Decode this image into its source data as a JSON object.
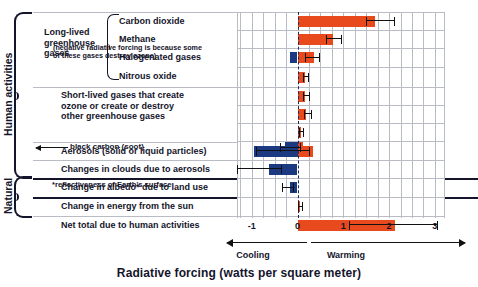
{
  "groups": {
    "human_label": "Human activities",
    "natural_label": "Natural",
    "long_lived_label": "Long-lived greenhouse gases"
  },
  "annotations": {
    "halogenated_note": "(negative radiative forcing is because some of these gases destroy ozone)",
    "black_carbon": "black carbon (soot)",
    "albedo_footnote": "*reflectiveness of Earth's surface"
  },
  "axis": {
    "title": "Radiative forcing (watts per square meter)",
    "cooling_label": "Cooling",
    "warming_label": "Warming",
    "ticks": [
      "-1",
      "0",
      "1",
      "2",
      "3"
    ]
  },
  "colors": {
    "positive": "#e8491d",
    "negative": "#1b3a82",
    "zero_line": "#1b2a5e",
    "grid": "#b9bcc4",
    "text": "#14142b"
  },
  "chart_data": {
    "type": "bar",
    "orientation": "horizontal",
    "title": "Radiative forcing (watts per square meter)",
    "xlabel": "Radiative forcing (watts per square meter)",
    "ylabel": "",
    "xlim": [
      -1.3,
      3.2
    ],
    "xticks": [
      -1,
      0,
      1,
      2,
      3
    ],
    "grid": true,
    "grid_interval": 0.25,
    "legend": "none",
    "categories": [
      "Carbon dioxide",
      "Methane",
      "Halogenated gases",
      "Nitrous oxide",
      "Short-lived gases that create ozone or create or destroy other greenhouse gases",
      "Short-lived gases row 2",
      "Short-lived gases row 3",
      "Short-lived gases row 4",
      "Aerosols (solid or liquid particles)",
      "Changes in clouds due to aerosols",
      "Change in albedo* due to land use",
      "Change in energy from the sun",
      "Net total due to human activities"
    ],
    "rows": [
      {
        "label": "Carbon dioxide",
        "group": "long-lived",
        "pos": 1.7,
        "neg": 0.0,
        "err_low": 1.5,
        "err_high": 2.1
      },
      {
        "label": "Methane",
        "group": "long-lived",
        "pos": 0.78,
        "neg": 0.0,
        "err_low": 0.63,
        "err_high": 0.94
      },
      {
        "label": "Halogenated gases",
        "group": "long-lived",
        "pos": 0.35,
        "neg": -0.16,
        "err_low": 0.16,
        "err_high": 0.48
      },
      {
        "label": "Nitrous oxide",
        "group": "long-lived",
        "pos": 0.16,
        "neg": 0.0,
        "err_low": 0.12,
        "err_high": 0.22
      },
      {
        "label": "",
        "group": "short-lived",
        "pos": 0.17,
        "neg": 0.0,
        "err_low": 0.13,
        "err_high": 0.25
      },
      {
        "label": "",
        "group": "short-lived",
        "pos": 0.19,
        "neg": 0.0,
        "err_low": 0.14,
        "err_high": 0.3
      },
      {
        "label": "",
        "group": "short-lived",
        "pos": 0.08,
        "neg": 0.0,
        "err_low": 0.04,
        "err_high": 0.13
      },
      {
        "label": "",
        "group": "short-lived",
        "pos": 0.13,
        "neg": -0.28,
        "err_low": -0.38,
        "err_high": 0.05
      },
      {
        "label": "Aerosols (solid or liquid particles)",
        "group": "human",
        "pos": 0.33,
        "neg": -0.95,
        "err_low": -0.9,
        "err_high": 0.25
      },
      {
        "label": "Changes in clouds due to aerosols",
        "group": "human",
        "pos": 0.0,
        "neg": -0.63,
        "err_low": -1.33,
        "err_high": -0.35
      },
      {
        "label": "Change in albedo* due to land use",
        "group": "human",
        "pos": 0.0,
        "neg": -0.16,
        "err_low": -0.34,
        "err_high": -0.1
      },
      {
        "label": "Change in energy from the sun",
        "group": "natural",
        "pos": 0.05,
        "neg": 0.0,
        "err_low": 0.02,
        "err_high": 0.09
      },
      {
        "label": "Net total due to human activities",
        "group": "total",
        "pos": 2.14,
        "neg": 0.0,
        "err_low": 1.12,
        "err_high": 3.05
      }
    ]
  },
  "row_labels": {
    "carbon_dioxide": "Carbon dioxide",
    "methane": "Methane",
    "halogenated": "Halogenated gases",
    "nitrous_oxide": "Nitrous oxide",
    "short_lived_l1": "Short-lived gases that create",
    "short_lived_l2": "ozone or create or destroy",
    "short_lived_l3": "other greenhouse gases",
    "aerosols": "Aerosols (solid or liquid particles)",
    "clouds": "Changes in clouds due to aerosols",
    "albedo": "Change in albedo* due to land use",
    "sun": "Change in energy from the sun",
    "net_total": "Net total due to human activities"
  }
}
